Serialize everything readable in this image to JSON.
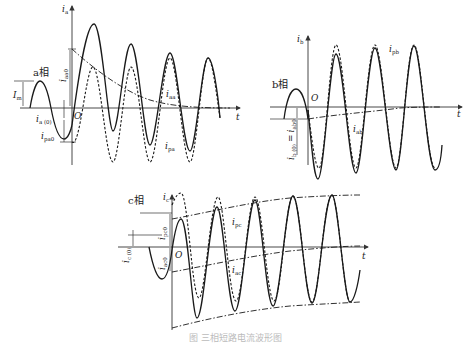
{
  "figure": {
    "caption": "图 三相短路电流波形图",
    "panels": [
      {
        "id": "a",
        "phase_label": "a相",
        "y_axis_label": "i",
        "y_axis_sub": "a",
        "x_axis_label": "t",
        "origin_label": "O",
        "labels": {
          "Im": "I",
          "Im_sub": "m",
          "ia0": "i",
          "ia0_sub": "a (0)",
          "ipa0": "i",
          "ipa0_sub": "pa0",
          "iaa0": "i",
          "iaa0_sub": "aa0",
          "iaa": "i",
          "iaa_sub": "aa",
          "ipa": "i",
          "ipa_sub": "pa"
        }
      },
      {
        "id": "b",
        "phase_label": "b相",
        "y_axis_label": "i",
        "y_axis_sub": "b",
        "x_axis_label": "t",
        "origin_label": "O",
        "labels": {
          "ipb": "i",
          "ipb_sub": "pb",
          "iab": "i",
          "iab_sub": "ab",
          "ib0": "i",
          "ib0_sub": "b (0)",
          "eq": "=",
          "iab0": "i",
          "iab0_sub": "ab0"
        }
      },
      {
        "id": "c",
        "phase_label": "c相",
        "y_axis_label": "i",
        "y_axis_sub": "c",
        "x_axis_label": "t",
        "origin_label": "O",
        "labels": {
          "ipc0": "i",
          "ipc0_sub": "pc0",
          "ic0": "i",
          "ic0_sub": "c (0)",
          "iac0": "i",
          "iac0_sub": "ac0",
          "ipc": "i",
          "ipc_sub": "pc",
          "iac": "i",
          "iac_sub": "ac"
        }
      }
    ],
    "legend": {
      "solid": "total short-circuit current",
      "dashed": "periodic component",
      "dashdot": "aperiodic (DC) component / envelope"
    }
  }
}
